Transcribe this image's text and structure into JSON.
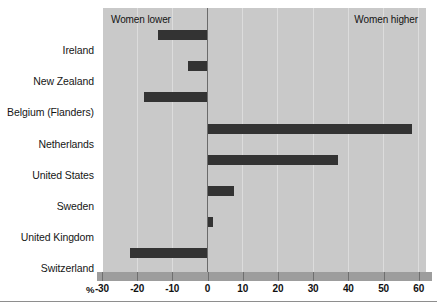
{
  "chart_data": {
    "type": "bar",
    "orientation": "horizontal",
    "title": "",
    "subtitle": "",
    "xlabel": "%",
    "ylabel": "",
    "xlim": [
      -30,
      62
    ],
    "ylim": null,
    "grid": true,
    "legend": null,
    "categories": [
      "Ireland",
      "New Zealand",
      "Belgium (Flanders)",
      "Netherlands",
      "United States",
      "Sweden",
      "United Kingdom",
      "Switzerland"
    ],
    "values": [
      -14,
      -5.5,
      -18,
      58,
      37,
      7.5,
      1.5,
      -22
    ],
    "xticks": [
      -30,
      -20,
      -10,
      0,
      10,
      20,
      30,
      40,
      50,
      60
    ],
    "xticklabels": [
      "-30",
      "-20",
      "-10",
      "0",
      "10",
      "20",
      "30",
      "40",
      "50",
      "60"
    ],
    "annotations": [
      {
        "text": "Women lower",
        "position": "top-left"
      },
      {
        "text": "Women higher",
        "position": "top-right"
      }
    ],
    "colors": {
      "bar": "#333333",
      "panel_background": "#c9c9c9",
      "gridline": "#dcdcdc",
      "zeroline": "#6b6b6b",
      "axis_strip": "#9d9d9d",
      "text": "#161616"
    }
  },
  "axis": {
    "unit_symbol": "%"
  },
  "annotations": {
    "women_lower": "Women lower",
    "women_higher": "Women higher"
  }
}
